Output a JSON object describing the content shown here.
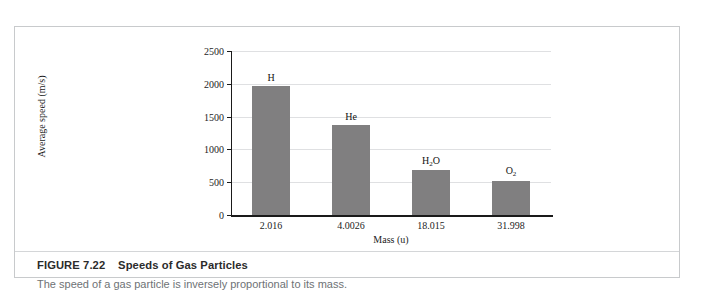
{
  "figure": {
    "caption_label": "FIGURE 7.22",
    "caption_title": "Speeds of Gas Particles",
    "caption_subtitle": "The speed of a gas particle is inversely proportional to its mass."
  },
  "colors": {
    "bar_fill": "#807f80",
    "gridline": "#dfe0e2",
    "axis": "#1a1a1a",
    "frame_border": "#c8cacc",
    "caption_title_color": "#2b2b2b",
    "caption_sub_color": "#6e7275"
  },
  "chart_data": {
    "type": "bar",
    "title": "",
    "xlabel": "Mass (u)",
    "ylabel": "Average speed (m/s)",
    "categories": [
      "2.016",
      "4.0026",
      "18.015",
      "31.998"
    ],
    "values": [
      1970,
      1370,
      680,
      520
    ],
    "point_labels": [
      "H",
      "He",
      "H2O",
      "O2"
    ],
    "point_labels_html": [
      "H",
      "He",
      "H<sub>2</sub>O",
      "O<sub>2</sub>"
    ],
    "ylim": [
      0,
      2500
    ],
    "yticks": [
      0,
      500,
      1000,
      1500,
      2000,
      2500
    ],
    "ytick_labels": [
      "0",
      "500",
      "1000",
      "1500",
      "2000",
      "2500"
    ],
    "grid": true,
    "legend": false,
    "legend_position": "none"
  }
}
